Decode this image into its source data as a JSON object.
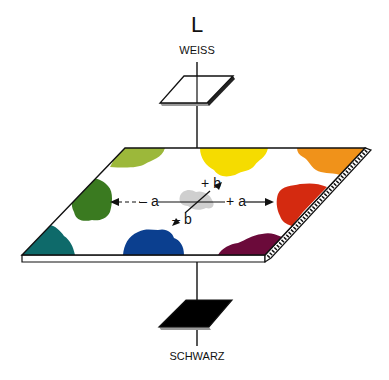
{
  "diagram": {
    "axis_L": {
      "label": "L",
      "top_label": "WEISS",
      "bottom_label": "SCHWARZ"
    },
    "axis_a": {
      "negative_label": "– a",
      "positive_label": "+ a"
    },
    "axis_b": {
      "negative_label": "– b",
      "positive_label": "+ b"
    },
    "colors": {
      "yellow_green": "#9cb83a",
      "green": "#3a7a20",
      "teal": "#0e6a6a",
      "blue": "#0b3f8f",
      "purple": "#6b0a3a",
      "red": "#d42a10",
      "orange": "#f0921a",
      "yellow": "#f5dc00",
      "gray_center": "#cfcfcf",
      "white_plane": "#ffffff",
      "black_plane": "#000000"
    }
  }
}
